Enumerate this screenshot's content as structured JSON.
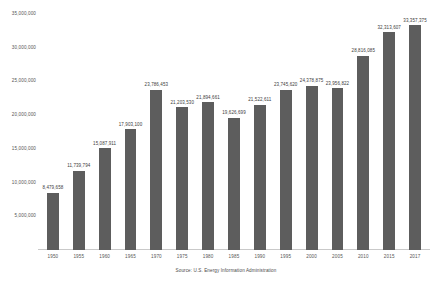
{
  "chart_data": {
    "type": "bar",
    "title": "",
    "subtitle": "",
    "xlabel": "",
    "ylabel": "",
    "grid": false,
    "legend": "none",
    "ylim": [
      0,
      35000000
    ],
    "yticks": [
      5000000,
      10000000,
      15000000,
      20000000,
      25000000,
      30000000,
      35000000
    ],
    "ytick_labels": [
      "5,000,000",
      "10,000,000",
      "15,000,000",
      "20,000,000",
      "25,000,000",
      "30,000,000",
      "35,000,000"
    ],
    "categories": [
      "1950",
      "1955",
      "1960",
      "1965",
      "1970",
      "1975",
      "1980",
      "1985",
      "1990",
      "1995",
      "2000",
      "2005",
      "2010",
      "2015",
      "2017"
    ],
    "values": [
      8479658,
      11739794,
      15087911,
      17903100,
      23786453,
      21203530,
      21894661,
      19626699,
      21522611,
      23745620,
      24378875,
      23956822,
      28816085,
      32313607,
      33357375
    ],
    "value_labels": [
      "8,479,658",
      "11,739,794",
      "15,087,911",
      "17,903,100",
      "23,786,453",
      "21,203,530",
      "21,894,661",
      "19,626,699",
      "21,522,611",
      "23,745,620",
      "24,378,875",
      "23,956,822",
      "28,816,085",
      "32,313,607",
      "33,357,375"
    ],
    "series": [
      {
        "name": "",
        "color": "#5d5d5d",
        "values": [
          8479658,
          11739794,
          15087911,
          17903100,
          23786453,
          21203530,
          21894661,
          19626699,
          21522611,
          23745620,
          24378875,
          23956822,
          28816085,
          32313607,
          33357375
        ]
      }
    ]
  },
  "annotations": {
    "source": "Source: U.S. Energy Information Administration"
  },
  "colors": {
    "bar": "#5d5d5d",
    "axis_line": "#c9c9c9",
    "label_text": "#3c3c3c",
    "tick_text": "#555555",
    "background": "#ffffff"
  }
}
